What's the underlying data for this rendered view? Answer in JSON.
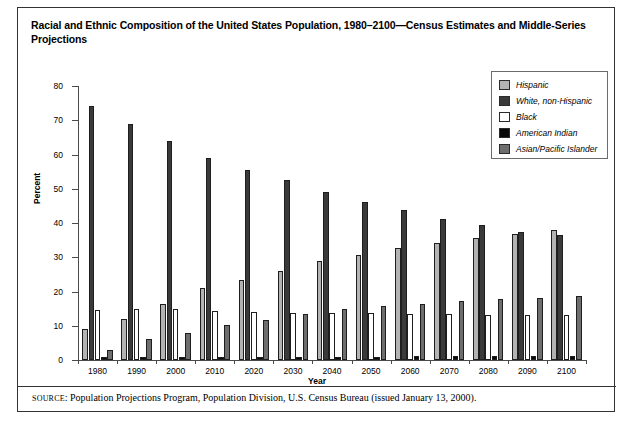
{
  "title": "Racial and Ethnic Composition of the United States Population, 1980–2100—Census Estimates and Middle-Series Projections",
  "source": {
    "label": "SOURCE",
    "text": ": Population Projections Program, Population Division,  U.S. Census Bureau (issued January 13, 2000)."
  },
  "chart_data": {
    "type": "bar",
    "title": "Racial and Ethnic Composition of the United States Population, 1980–2100—Census Estimates and Middle-Series Projections",
    "xlabel": "Year",
    "ylabel": "Percent",
    "ylim": [
      0,
      80
    ],
    "yticks": [
      0,
      10,
      20,
      30,
      40,
      50,
      60,
      70,
      80
    ],
    "grid": false,
    "legend_position": "top-right",
    "categories": [
      "1980",
      "1990",
      "2000",
      "2010",
      "2020",
      "2030",
      "2040",
      "2050",
      "2060",
      "2070",
      "2080",
      "2090",
      "2100"
    ],
    "series": [
      {
        "name": "Hispanic",
        "color": "#b3b3b3",
        "values": [
          9.0,
          12.0,
          16.5,
          21.0,
          23.5,
          26.0,
          28.8,
          30.8,
          32.7,
          34.3,
          35.7,
          36.8,
          38.0
        ]
      },
      {
        "name": "White, non-Hispanic",
        "color": "#3a3a3a",
        "values": [
          74.3,
          69.0,
          64.0,
          59.0,
          55.5,
          52.5,
          49.0,
          46.0,
          43.7,
          41.3,
          39.3,
          37.5,
          36.5
        ]
      },
      {
        "name": "Black",
        "color": "#ffffff",
        "values": [
          14.5,
          15.0,
          14.9,
          14.3,
          14.0,
          13.8,
          13.8,
          13.6,
          13.5,
          13.3,
          13.2,
          13.2,
          13.2
        ]
      },
      {
        "name": "American Indian",
        "color": "#0a0a0a",
        "values": [
          1.0,
          1.0,
          1.0,
          1.0,
          1.0,
          1.0,
          1.0,
          1.0,
          1.1,
          1.1,
          1.1,
          1.1,
          1.1
        ]
      },
      {
        "name": "Asian/Pacific Islander",
        "color": "#6e6e6e",
        "values": [
          3.0,
          6.0,
          8.0,
          10.3,
          11.8,
          13.5,
          14.8,
          15.8,
          16.5,
          17.1,
          17.8,
          18.2,
          18.6
        ]
      }
    ]
  }
}
